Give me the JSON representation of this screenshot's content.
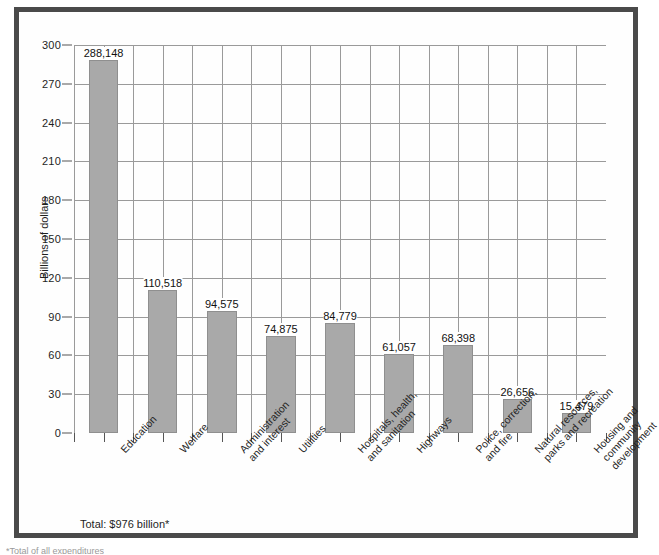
{
  "figure": {
    "y_axis_title": "Billions of dollars",
    "total_note": "Total: $976 billion*",
    "footnote": "*Total of all expenditures"
  },
  "chart_data": {
    "type": "bar",
    "title": "",
    "subtitle": "",
    "xlabel": "",
    "ylabel": "Billions of dollars",
    "ylim": [
      0,
      300
    ],
    "ytick_labels": [
      "0",
      "30",
      "60",
      "90",
      "120",
      "150",
      "180",
      "210",
      "240",
      "270",
      "300"
    ],
    "ytick_values": [
      0,
      30,
      60,
      90,
      120,
      150,
      180,
      210,
      240,
      270,
      300
    ],
    "grid": true,
    "legend": "none",
    "units": "millions of dollars (labels); billions of dollars (axis)",
    "categories": [
      "Education",
      "Welfare",
      "Administration\nand interest",
      "Utilities",
      "Hospitals, health,\nand sanitation",
      "Highways",
      "Police, correction,\nand fire",
      "Natural resources,\nparks and recreation",
      "Housing and\ncommunity\ndevelopment"
    ],
    "values": [
      288.148,
      110.518,
      94.575,
      74.875,
      84.779,
      61.057,
      68.398,
      26.656,
      15.479
    ],
    "value_labels": [
      "288,148",
      "110,518",
      "94,575",
      "74,875",
      "84,779",
      "61,057",
      "68,398",
      "26,656",
      "15,479"
    ],
    "annotations": [
      "Total: $976 billion*"
    ],
    "bar_color": "#a9a9a9",
    "bar_border_color": "#8f8f8f",
    "grid_color": "#9a9a9a",
    "axis_color": "#555555"
  }
}
